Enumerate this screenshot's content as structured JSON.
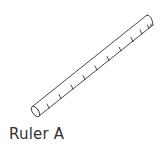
{
  "figure": {
    "label": "Ruler A",
    "object": "ruler-icon",
    "stroke_color": "#333333",
    "tick_count": 11
  }
}
